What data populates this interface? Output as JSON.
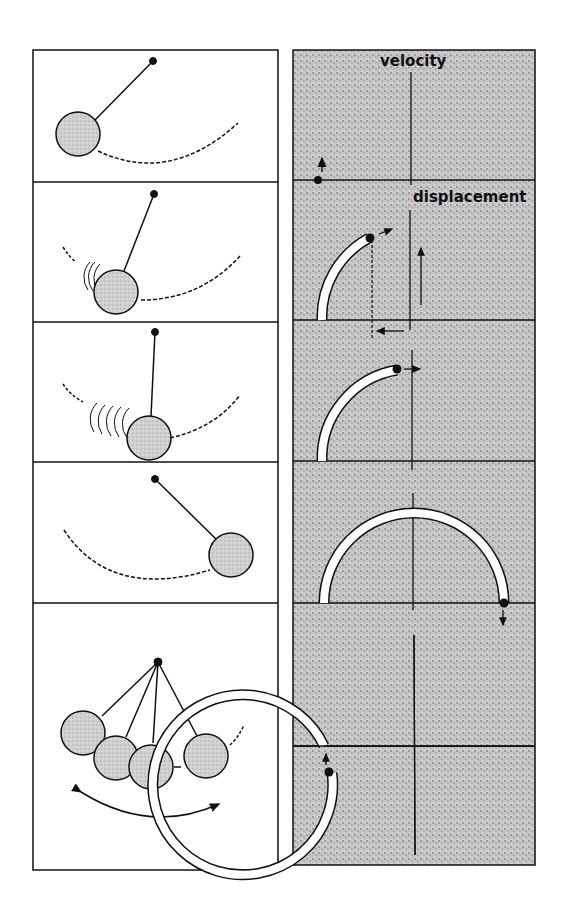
{
  "figure": {
    "labels": {
      "velocity_axis": "velocity",
      "displacement_axis": "displacement"
    },
    "colors": {
      "line": "#111111",
      "stipple_background": "#bdbdbd",
      "bob_fill": "#c8c8c8",
      "panel_background": "#ffffff"
    },
    "left_column": {
      "panels": [
        {
          "id": 1,
          "description": "Pendulum bob at left extreme, dashed arc path"
        },
        {
          "id": 2,
          "description": "Bob swinging right with motion trail"
        },
        {
          "id": 3,
          "description": "Bob near bottom with longer motion trail"
        },
        {
          "id": 4,
          "description": "Bob at right extreme"
        },
        {
          "id": 5,
          "description": "Multiple bob positions with double-headed swing arrow"
        }
      ]
    },
    "right_column": {
      "panels": [
        {
          "id": 1,
          "description": "Point at left on displacement axis, velocity arrow up"
        },
        {
          "id": 2,
          "description": "Quarter-arc trace, projection arrows"
        },
        {
          "id": 3,
          "description": "Arc reaching top of circle"
        },
        {
          "id": 4,
          "description": "Semicircle trace, point at right moving down"
        },
        {
          "id": 5,
          "description": "Near-complete circle trace"
        }
      ]
    }
  }
}
